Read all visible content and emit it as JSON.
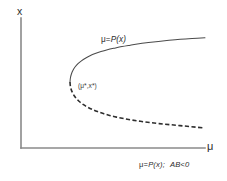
{
  "figure": {
    "kind": "bifurcation-diagram",
    "background_color": "#ffffff",
    "axis_color": "#8a8a8a",
    "curve_color": "#4a4a4a",
    "dashed_curve_color": "#2e2e2e",
    "y_axis_label": "x",
    "x_axis_label": "μ",
    "curve_label_mu": "μ=",
    "curve_label_p": "P",
    "curve_label_arg": "(x)",
    "critical_point_label": "(μ*,x*)",
    "caption_mu": "μ=",
    "caption_p": "P",
    "caption_arg": "(x);",
    "caption_condition": "AB<0"
  },
  "chart_data": {
    "type": "line",
    "title": "",
    "subtitle": "",
    "xlabel": "μ",
    "ylabel": "x",
    "grid": false,
    "legend": "none",
    "xlim": [
      0,
      227
    ],
    "ylim": [
      181,
      0
    ],
    "axes": {
      "origin": [
        21,
        148
      ],
      "y_axis_top": [
        21,
        18
      ],
      "x_axis_right": [
        205,
        148
      ]
    },
    "annotations": [
      {
        "text": "μ=P(x)",
        "x": 101,
        "y": 36,
        "role": "curve-label"
      },
      {
        "text": "(μ*,x*)",
        "x": 78,
        "y": 83,
        "role": "fold-point-label"
      },
      {
        "text": "μ=P(x);  AB<0",
        "x": 139,
        "y": 161,
        "role": "caption"
      }
    ],
    "fold_point": {
      "mu": 70,
      "x": 82,
      "label": "(μ*,x*)"
    },
    "series": [
      {
        "name": "upper branch (stable)",
        "style": "solid",
        "points": [
          [
            70,
            82
          ],
          [
            70.4,
            78
          ],
          [
            71.4,
            74
          ],
          [
            73.0,
            70.2
          ],
          [
            75.2,
            66.8
          ],
          [
            78.0,
            63.6
          ],
          [
            81.4,
            60.8
          ],
          [
            85.4,
            58.2
          ],
          [
            90.0,
            55.8
          ],
          [
            95.2,
            53.6
          ],
          [
            101.0,
            51.6
          ],
          [
            107.4,
            49.8
          ],
          [
            114.4,
            48.2
          ],
          [
            122.0,
            46.6
          ],
          [
            130.2,
            45.2
          ],
          [
            139.0,
            43.8
          ],
          [
            148.4,
            42.6
          ],
          [
            158.4,
            41.4
          ],
          [
            169.0,
            40.3
          ],
          [
            180.2,
            39.3
          ],
          [
            192.0,
            38.5
          ],
          [
            205.0,
            37.8
          ]
        ]
      },
      {
        "name": "lower branch (unstable)",
        "style": "dashed",
        "points": [
          [
            70,
            82
          ],
          [
            70.3,
            85.6
          ],
          [
            71.1,
            89.2
          ],
          [
            72.5,
            92.7
          ],
          [
            74.4,
            96.0
          ],
          [
            76.9,
            99.1
          ],
          [
            79.9,
            102.0
          ],
          [
            83.5,
            104.7
          ],
          [
            87.6,
            107.2
          ],
          [
            92.3,
            109.5
          ],
          [
            97.5,
            111.6
          ],
          [
            103.3,
            113.6
          ],
          [
            109.6,
            115.4
          ],
          [
            116.5,
            117.1
          ],
          [
            123.9,
            118.6
          ],
          [
            131.9,
            120.0
          ],
          [
            140.4,
            121.3
          ],
          [
            149.5,
            122.5
          ],
          [
            159.1,
            123.6
          ],
          [
            169.3,
            124.6
          ],
          [
            180.0,
            125.6
          ],
          [
            191.3,
            126.7
          ],
          [
            203.0,
            127.8
          ]
        ]
      }
    ]
  }
}
